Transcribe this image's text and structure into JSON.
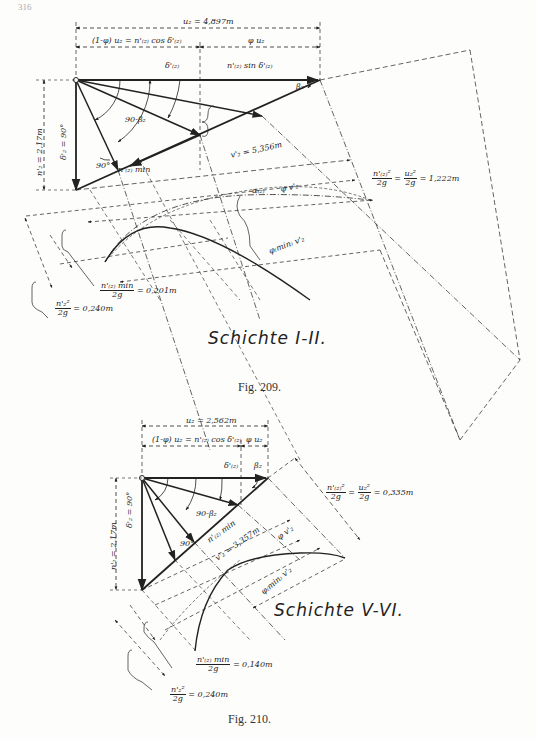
{
  "page": {
    "number": "316"
  },
  "figures": [
    {
      "id": "fig209",
      "caption": "Fig. 209.",
      "title": "Schichte I-II.",
      "labels": {
        "u2": "u₂ = 4,897m",
        "left_segment": "(1-φ) u₂ = n'₍₂₎ cos δ'₍₂₎",
        "right_segment": "φ u₂",
        "delta_label": "δ'₍₂₎",
        "n_sin": "n'₍₂₎ sin δ'₍₂₎",
        "beta2": "β₂",
        "angle_90_beta": "90-β₂",
        "delta2_90": "δ'₂ = 90°",
        "n2_height": "n'₂ = 2,17m",
        "right_angle": "90°",
        "n_min": "n'₍₂₎ min",
        "v2": "v'₂ = 5,356m",
        "alpha": "α₍₂₎",
        "phi_v2": "φ v'₂",
        "phi_min_v2": "φ₍min₎ v'₂",
        "head_num": "n'₍₂₎²",
        "head_den": "2g",
        "head_num2": "u₂²",
        "head_den2": "2g",
        "head_value": "= 1,222m",
        "nmin_num": "n'₍₂₎ min",
        "nmin_value": "= 0,201m",
        "n2_num": "n'₂²",
        "n2_value": "= 0,240m"
      }
    },
    {
      "id": "fig210",
      "caption": "Fig. 210.",
      "title": "Schichte V-VI.",
      "labels": {
        "u2": "u₂ = 2,562m",
        "left_segment": "(1-φ) u₂ = n'₍₂₎ cos δ'₍₂₎",
        "right_segment": "φ u₂",
        "delta_label": "δ'₍₂₎",
        "beta2": "β₂",
        "angle_90_beta": "90-β₂",
        "delta2_90": "δ'₂ = 90°",
        "n2_height": "n'₂ = 2,17m",
        "right_angle": "90°",
        "n_min": "n'₍₂₎ min",
        "v2": "v'₂ = 3,357m",
        "phi_v2": "φ v'₂",
        "phi_min_v2": "φ₍min₎ v'₂",
        "head_num": "n'₍₂₎²",
        "head_den": "2g",
        "head_num2": "u₂²",
        "head_den2": "2g",
        "head_value": "= 0,335m",
        "nmin_num": "n'₍₂₎ min",
        "nmin_value": "= 0,140m",
        "n2_num": "n'₂²",
        "n2_value": "= 0,240m"
      }
    }
  ]
}
